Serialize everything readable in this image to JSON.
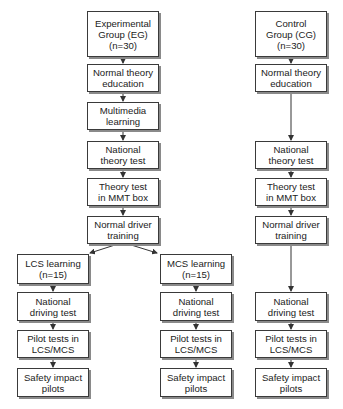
{
  "diagram": {
    "type": "flowchart",
    "colors": {
      "box_border": "#3a3a3a",
      "shadow": "#8a8a8a",
      "text": "#222222",
      "arrow": "#333333"
    },
    "experimental": {
      "group": "Experimental\nGroup (EG)\n(n=30)",
      "normal_theory": "Normal theory\neducation",
      "multimedia": "Multimedia\nlearning",
      "national_theory": "National\ntheory test",
      "theory_mmt": "Theory test\nin MMT box",
      "normal_driver": "Normal driver\ntraining"
    },
    "lcs": {
      "learning": "LCS learning\n(n=15)",
      "national_driving": "National\ndriving test",
      "pilot": "Pilot tests in\nLCS/MCS",
      "safety": "Safety impact\npilots"
    },
    "mcs": {
      "learning": "MCS learning\n(n=15)",
      "national_driving": "National\ndriving test",
      "pilot": "Pilot tests in\nLCS/MCS",
      "safety": "Safety impact\npilots"
    },
    "control": {
      "group": "Control\nGroup (CG)\n(n=30)",
      "normal_theory": "Normal theory\neducation",
      "national_theory": "National\ntheory test",
      "theory_mmt": "Theory test\nin MMT box",
      "normal_driver": "Normal driver\ntraining",
      "national_driving": "National\ndriving test",
      "pilot": "Pilot tests in\nLCS/MCS",
      "safety": "Safety impact\npilots"
    }
  }
}
